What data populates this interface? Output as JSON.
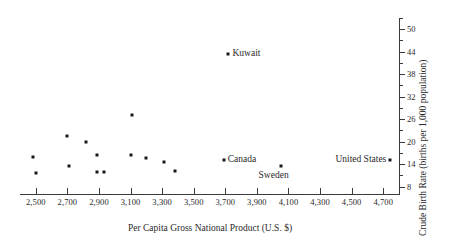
{
  "chart_data": {
    "type": "scatter",
    "title": "",
    "xlabel": "Per Capita Gross National Product  (U.S. $)",
    "ylabel": "Crude Birth Rate  (births per 1,000 population)",
    "xlim": [
      2400,
      4800
    ],
    "ylim": [
      6,
      53
    ],
    "grid": false,
    "legend": "none",
    "x_ticks": [
      "2,500",
      "2,700",
      "2,900",
      "3,100",
      "3,300",
      "3,500",
      "3,700",
      "3,900",
      "4,100",
      "4,300",
      "4,500",
      "4,700"
    ],
    "x_tick_values": [
      2500,
      2700,
      2900,
      3100,
      3300,
      3500,
      3700,
      3900,
      4100,
      4300,
      4500,
      4700
    ],
    "y_ticks": [
      "8",
      "14",
      "20",
      "26",
      "32",
      "38",
      "44",
      "50"
    ],
    "y_tick_values": [
      8,
      14,
      20,
      26,
      32,
      38,
      44,
      50
    ],
    "y_minor_step": 3,
    "points": [
      {
        "x": 2480,
        "y": 16.0,
        "label": ""
      },
      {
        "x": 2500,
        "y": 11.5,
        "label": ""
      },
      {
        "x": 2700,
        "y": 21.5,
        "label": ""
      },
      {
        "x": 2710,
        "y": 13.5,
        "label": ""
      },
      {
        "x": 2820,
        "y": 20.0,
        "label": ""
      },
      {
        "x": 2890,
        "y": 16.5,
        "label": ""
      },
      {
        "x": 2885,
        "y": 11.8,
        "label": ""
      },
      {
        "x": 2935,
        "y": 11.8,
        "label": ""
      },
      {
        "x": 3110,
        "y": 27.0,
        "label": ""
      },
      {
        "x": 3100,
        "y": 16.5,
        "label": ""
      },
      {
        "x": 3200,
        "y": 15.5,
        "label": ""
      },
      {
        "x": 3310,
        "y": 14.6,
        "label": ""
      },
      {
        "x": 3380,
        "y": 12.2,
        "label": ""
      },
      {
        "x": 3720,
        "y": 43.5,
        "label": "Kuwait"
      },
      {
        "x": 3690,
        "y": 15.2,
        "label": "Canada"
      },
      {
        "x": 4050,
        "y": 13.4,
        "label": "Sweden"
      },
      {
        "x": 4745,
        "y": 15.2,
        "label": "United States"
      }
    ],
    "annotations": [
      {
        "text": "Kuwait",
        "for_point": 13,
        "placement": "right"
      },
      {
        "text": "Canada",
        "for_point": 14,
        "placement": "right"
      },
      {
        "text": "Sweden",
        "for_point": 15,
        "placement": "below"
      },
      {
        "text": "United States",
        "for_point": 16,
        "placement": "left"
      }
    ]
  }
}
